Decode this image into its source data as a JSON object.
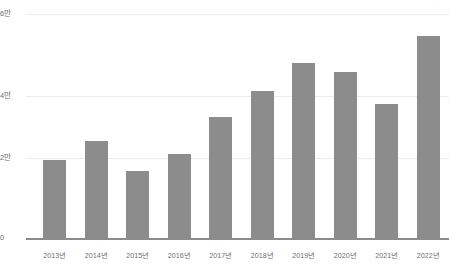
{
  "watermark": {
    "text": "···"
  },
  "chart_data": {
    "type": "bar",
    "title": "",
    "subtitle": "",
    "xlabel": "",
    "ylabel": "",
    "categories": [
      "2013년",
      "2014년",
      "2015년",
      "2016년",
      "2017년",
      "2018년",
      "2019년",
      "2020년",
      "2021년",
      "2022년"
    ],
    "values": [
      2.1,
      2.6,
      1.8,
      2.25,
      3.25,
      3.95,
      4.7,
      4.45,
      3.6,
      5.4
    ],
    "unit": "만",
    "ylim": [
      0,
      6
    ],
    "yticks": [
      0,
      2,
      4,
      6
    ],
    "ytick_labels": [
      "0",
      "2만",
      "4만",
      "6만"
    ],
    "grid": true,
    "legend": "none",
    "series": [
      {
        "name": "",
        "color": "#8c8c8c",
        "values": [
          2.1,
          2.6,
          1.8,
          2.25,
          3.25,
          3.95,
          4.7,
          4.45,
          3.6,
          5.4
        ]
      }
    ],
    "colors": {
      "bar": "#8c8c8c",
      "grid": "#ececed",
      "axis": "#8c8c8c",
      "tick_text": "#6e6e73",
      "background": "#ffffff"
    }
  }
}
